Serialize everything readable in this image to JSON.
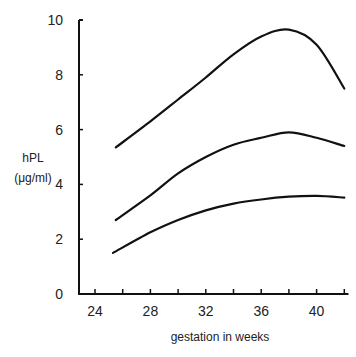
{
  "chart_data": {
    "type": "line",
    "title": "",
    "xlabel": "gestation in weeks",
    "ylabel": "hPL (μg/ml)",
    "ylabel_lines": [
      "hPL",
      "(μg/ml)"
    ],
    "xlim": [
      23,
      42.3
    ],
    "ylim": [
      0,
      10
    ],
    "x_ticks": [
      24,
      26,
      28,
      30,
      32,
      34,
      36,
      38,
      40,
      42
    ],
    "x_tick_labels": [
      "24",
      "28",
      "32",
      "36",
      "40"
    ],
    "y_ticks": [
      0,
      2,
      4,
      6,
      8,
      10
    ],
    "y_tick_labels": [
      "0",
      "2",
      "4",
      "6",
      "8",
      "10"
    ],
    "grid": false,
    "legend": null,
    "series": [
      {
        "name": "upper curve",
        "x": [
          25.5,
          28,
          30,
          32,
          34,
          36,
          38,
          40,
          42
        ],
        "values": [
          5.35,
          6.3,
          7.1,
          7.9,
          8.75,
          9.4,
          9.65,
          9.1,
          7.5
        ]
      },
      {
        "name": "middle curve",
        "x": [
          25.5,
          28,
          30,
          32,
          34,
          36,
          38,
          40,
          42
        ],
        "values": [
          2.7,
          3.6,
          4.4,
          5.0,
          5.45,
          5.7,
          5.9,
          5.7,
          5.4
        ]
      },
      {
        "name": "lower curve",
        "x": [
          25.3,
          28,
          30,
          32,
          34,
          36,
          38,
          40,
          42
        ],
        "values": [
          1.5,
          2.25,
          2.7,
          3.05,
          3.3,
          3.45,
          3.55,
          3.58,
          3.52
        ]
      }
    ],
    "line_color": "#111111"
  }
}
